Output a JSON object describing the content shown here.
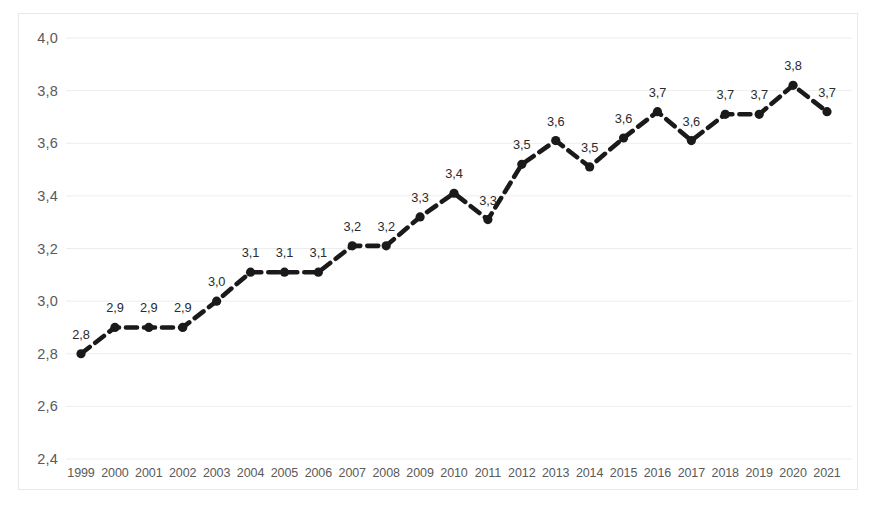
{
  "chart_data": {
    "type": "line",
    "title": "",
    "subtitle": "",
    "xlabel": "",
    "ylabel": "",
    "categories": [
      "1999",
      "2000",
      "2001",
      "2002",
      "2003",
      "2004",
      "2005",
      "2006",
      "2007",
      "2008",
      "2009",
      "2010",
      "2011",
      "2012",
      "2013",
      "2014",
      "2015",
      "2016",
      "2017",
      "2018",
      "2019",
      "2020",
      "2021"
    ],
    "values": [
      2.8,
      2.9,
      2.9,
      2.9,
      3.0,
      3.11,
      3.11,
      3.11,
      3.21,
      3.21,
      3.32,
      3.41,
      3.31,
      3.52,
      3.61,
      3.51,
      3.62,
      3.72,
      3.61,
      3.71,
      3.71,
      3.82,
      3.72
    ],
    "data_labels": [
      "2,8",
      "2,9",
      "2,9",
      "2,9",
      "3,0",
      "3,1",
      "3,1",
      "3,1",
      "3,2",
      "3,2",
      "3,3",
      "3,4",
      "3,3",
      "3,5",
      "3,6",
      "3,5",
      "3,6",
      "3,7",
      "3,6",
      "3,7",
      "3,7",
      "3,8",
      "3,7"
    ],
    "ylim": [
      2.4,
      4.0
    ],
    "yticks": [
      2.4,
      2.6,
      2.8,
      3.0,
      3.2,
      3.4,
      3.6,
      3.8,
      4.0
    ],
    "ytick_labels": [
      "2,4",
      "2,6",
      "2,8",
      "3,0",
      "3,2",
      "3,4",
      "3,6",
      "3,8",
      "4,0"
    ],
    "grid": true,
    "legend": "none",
    "series_color": "#1a1a1a",
    "grid_color": "#ededed",
    "border_color": "#e8e8e8",
    "background_color": "#ffffff",
    "line_style": "dashed",
    "marker": "circle",
    "decimal_separator": ","
  }
}
